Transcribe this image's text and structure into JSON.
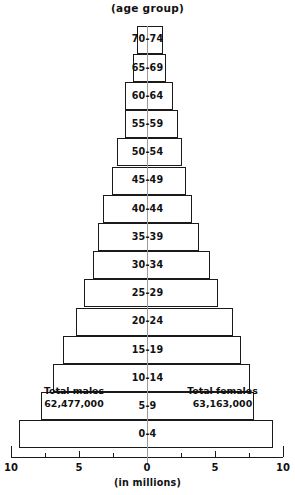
{
  "chart_data": {
    "type": "bar",
    "title": "(age group)",
    "xlabel": "(in millions)",
    "ylabel": "",
    "orientation": "population-pyramid",
    "categories": [
      "0-4",
      "5-9",
      "10-14",
      "15-19",
      "20-24",
      "25-29",
      "30-34",
      "35-39",
      "40-44",
      "45-49",
      "50-54",
      "55-59",
      "60-64",
      "65-69",
      "70-74"
    ],
    "xlim": [
      -10,
      10
    ],
    "xticks": [
      10,
      5,
      0,
      5,
      10
    ],
    "xtick_labels": [
      "10",
      "5",
      "0",
      "5",
      "10"
    ],
    "grid": false,
    "legend": "none",
    "series": [
      {
        "name": "Males",
        "side": "left",
        "values": [
          9.4,
          7.8,
          6.9,
          6.2,
          5.2,
          4.6,
          4.0,
          3.6,
          3.2,
          2.6,
          2.2,
          1.6,
          1.6,
          1.0,
          0.7
        ]
      },
      {
        "name": "Females",
        "side": "right",
        "values": [
          9.3,
          7.9,
          7.6,
          6.9,
          6.3,
          5.2,
          4.6,
          3.8,
          3.3,
          2.9,
          2.6,
          2.3,
          1.9,
          1.4,
          1.2
        ]
      }
    ],
    "annotations": [
      {
        "name": "total-males",
        "line1": "Total males",
        "line2": "62,477,000"
      },
      {
        "name": "total-females",
        "line1": "Total females",
        "line2": "63,163,000"
      }
    ]
  },
  "labels": {
    "title": "(age group)",
    "axis_caption": "(in millions)",
    "total_males_title": "Total males",
    "total_males_value": "62,477,000",
    "total_females_title": "Total females",
    "total_females_value": "63,163,000",
    "ticks": [
      "10",
      "5",
      "0",
      "5",
      "10"
    ],
    "bands": [
      "70-74",
      "65-69",
      "60-64",
      "55-59",
      "50-54",
      "45-49",
      "40-44",
      "35-39",
      "30-34",
      "25-29",
      "20-24",
      "15-19",
      "10-14",
      "5-9",
      "0-4"
    ]
  }
}
